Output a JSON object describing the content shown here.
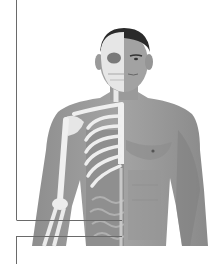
{
  "figure": {
    "palette": {
      "background": "#ffffff",
      "skin_dark": "#8a8a8a",
      "skin_mid": "#9c9c9c",
      "skin_light": "#b4b4b4",
      "bone": "#ececec",
      "hair": "#2a2a2a",
      "organ": "#9a9a9a",
      "leader_line": "#6a6a6a"
    },
    "leader_lines": [
      {
        "type": "vertical",
        "x": 16,
        "y1": 0,
        "y2": 220
      },
      {
        "type": "horizontal",
        "y": 220,
        "x1": 16,
        "x2": 122
      },
      {
        "type": "horizontal",
        "y": 236,
        "x1": 16,
        "x2": 122
      },
      {
        "type": "vertical",
        "x": 16,
        "y1": 236,
        "y2": 264
      }
    ]
  }
}
